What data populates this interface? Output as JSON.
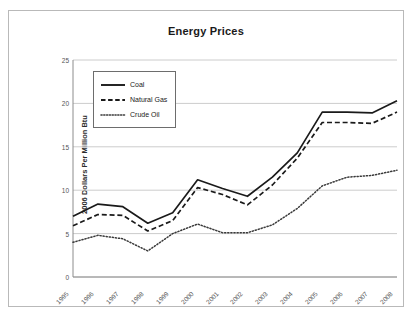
{
  "figure": {
    "border_color": "#b9b9b9",
    "background": "#ffffff"
  },
  "chart_data": {
    "type": "line",
    "title": "Energy Prices",
    "xlabel": "",
    "ylabel": "2006 Dollars Per Million Btu",
    "x": [
      1995,
      1996,
      1997,
      1998,
      1999,
      2000,
      2001,
      2002,
      2003,
      2004,
      2005,
      2006,
      2007,
      2008
    ],
    "categories": [
      "1995",
      "1996",
      "1997",
      "1998",
      "1999",
      "2000",
      "2001",
      "2002",
      "2003",
      "2004",
      "2005",
      "2006",
      "2007",
      "2008"
    ],
    "ylim": [
      0,
      25
    ],
    "yticks": [
      0,
      5,
      10,
      15,
      20,
      25
    ],
    "ytick_labels": [
      "0",
      "5",
      "10",
      "15",
      "20",
      "25"
    ],
    "grid": true,
    "grid_axis": "y",
    "grid_color": "#cccccc",
    "legend_position": "upper left",
    "series": [
      {
        "name": "Coal",
        "style": "solid",
        "color": "#1a1a1a",
        "values": [
          7.0,
          8.4,
          8.1,
          6.2,
          7.4,
          11.2,
          10.2,
          9.3,
          11.5,
          14.3,
          19.0,
          19.0,
          18.9,
          20.3
        ]
      },
      {
        "name": "Natural Gas",
        "style": "dashed",
        "color": "#1a1a1a",
        "values": [
          5.9,
          7.2,
          7.1,
          5.3,
          6.5,
          10.3,
          9.5,
          8.3,
          10.6,
          13.7,
          17.8,
          17.8,
          17.7,
          19.0
        ]
      },
      {
        "name": "Crude Oil",
        "style": "dotted",
        "color": "#3a3a3a",
        "values": [
          4.0,
          4.8,
          4.4,
          3.0,
          5.0,
          6.1,
          5.1,
          5.1,
          6.0,
          7.9,
          10.5,
          11.5,
          11.7,
          12.3
        ]
      }
    ]
  },
  "legend": {
    "items": [
      {
        "label": "Coal",
        "style": "solid"
      },
      {
        "label": "Natural Gas",
        "style": "dashed"
      },
      {
        "label": "Crude Oil",
        "style": "dotted"
      }
    ]
  }
}
